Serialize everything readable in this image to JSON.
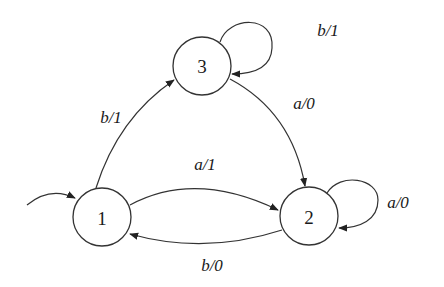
{
  "diagram": {
    "type": "finite-state-machine (Mealy)",
    "initial_state": "1",
    "states": [
      {
        "id": "1",
        "label": "1"
      },
      {
        "id": "2",
        "label": "2"
      },
      {
        "id": "3",
        "label": "3"
      }
    ],
    "transitions": [
      {
        "from": "1",
        "to": "3",
        "label": "b/1"
      },
      {
        "from": "1",
        "to": "2",
        "label": "a/1"
      },
      {
        "from": "2",
        "to": "1",
        "label": "b/0"
      },
      {
        "from": "3",
        "to": "3",
        "label": "b/1"
      },
      {
        "from": "3",
        "to": "2",
        "label": "a/0"
      },
      {
        "from": "2",
        "to": "2",
        "label": "a/0"
      }
    ],
    "colors": {
      "stroke": "#333333",
      "text": "#1a1a1a",
      "background": "#ffffff"
    }
  }
}
